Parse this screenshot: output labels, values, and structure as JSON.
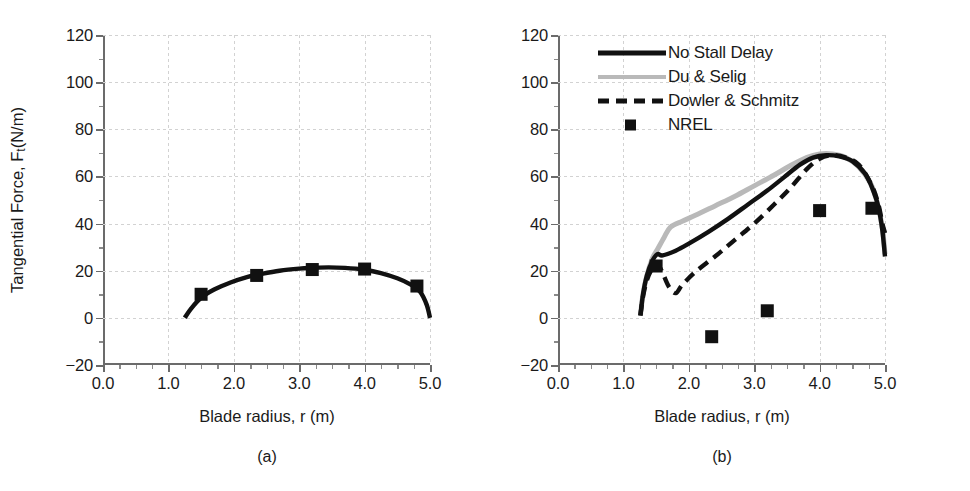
{
  "figure": {
    "panels": [
      {
        "id": "a",
        "subcaption": "(a)",
        "xlabel": "Blade radius, r (m)",
        "ylabel_prefix": "Tangential Force, F",
        "ylabel_sub": "t",
        "ylabel_suffix": "(N/m)"
      },
      {
        "id": "b",
        "subcaption": "(b)",
        "xlabel": "Blade radius, r (m)",
        "ylabel_prefix": "Tangential Force, F",
        "ylabel_sub": "t",
        "ylabel_suffix": "(N/m)"
      }
    ],
    "legend": {
      "position": "top-left-inside-panel-b",
      "items": [
        {
          "label": "No Stall Delay",
          "style": "solid",
          "color": "#111111"
        },
        {
          "label": "Du & Selig",
          "style": "solid",
          "color": "#b9b9b9"
        },
        {
          "label": "Dowler & Schmitz",
          "style": "dashed",
          "color": "#111111"
        },
        {
          "label": "NREL",
          "style": "marker",
          "color": "#111111"
        }
      ]
    }
  },
  "chart_data": [
    {
      "type": "line",
      "panel": "a",
      "title": "",
      "xlabel": "Blade radius, r (m)",
      "ylabel": "Tangential Force, Ft (N/m)",
      "xlim": [
        0.0,
        5.0
      ],
      "ylim": [
        -20,
        120
      ],
      "xticks": [
        "0.0",
        "1.0",
        "2.0",
        "3.0",
        "4.0",
        "5.0"
      ],
      "xtick_values": [
        0.0,
        1.0,
        2.0,
        3.0,
        4.0,
        5.0
      ],
      "yticks": [
        "-20",
        "0",
        "20",
        "40",
        "60",
        "80",
        "100",
        "120"
      ],
      "ytick_values": [
        -20,
        0,
        20,
        40,
        60,
        80,
        100,
        120
      ],
      "grid": true,
      "legend": "none",
      "series": [
        {
          "name": "No Stall Delay",
          "style": "solid",
          "color": "#111111",
          "x": [
            1.25,
            1.35,
            1.5,
            1.7,
            1.95,
            2.2,
            2.4,
            2.7,
            3.0,
            3.2,
            3.45,
            3.7,
            4.0,
            4.25,
            4.5,
            4.7,
            4.85,
            4.95,
            5.0
          ],
          "y": [
            0.0,
            4.0,
            8.5,
            12.0,
            15.0,
            17.3,
            18.5,
            20.0,
            20.9,
            21.2,
            21.4,
            21.2,
            20.4,
            19.0,
            16.8,
            14.2,
            11.0,
            5.5,
            0.0
          ]
        },
        {
          "name": "NREL",
          "style": "marker",
          "color": "#111111",
          "x": [
            1.5,
            2.35,
            3.2,
            4.0,
            4.8
          ],
          "y": [
            10.0,
            18.0,
            20.5,
            20.7,
            13.5
          ]
        }
      ]
    },
    {
      "type": "line",
      "panel": "b",
      "title": "",
      "xlabel": "Blade radius, r (m)",
      "ylabel": "Tangential Force, Ft (N/m)",
      "xlim": [
        0.0,
        5.0
      ],
      "ylim": [
        -20,
        120
      ],
      "xticks": [
        "0.0",
        "1.0",
        "2.0",
        "3.0",
        "4.0",
        "5.0"
      ],
      "xtick_values": [
        0.0,
        1.0,
        2.0,
        3.0,
        4.0,
        5.0
      ],
      "yticks": [
        "-20",
        "0",
        "20",
        "40",
        "60",
        "80",
        "100",
        "120"
      ],
      "ytick_values": [
        -20,
        0,
        20,
        40,
        60,
        80,
        100,
        120
      ],
      "grid": true,
      "legend": "upper-left",
      "series": [
        {
          "name": "No Stall Delay",
          "style": "solid",
          "color": "#111111",
          "x": [
            1.26,
            1.3,
            1.36,
            1.44,
            1.52,
            1.6,
            1.8,
            2.0,
            2.3,
            2.6,
            2.9,
            3.2,
            3.45,
            3.7,
            3.9,
            4.1,
            4.3,
            4.5,
            4.7,
            4.82,
            4.9,
            4.96,
            5.0
          ],
          "y": [
            1.0,
            10.0,
            18.0,
            24.0,
            27.0,
            26.5,
            28.5,
            31.5,
            36.5,
            42.0,
            48.0,
            54.0,
            59.5,
            65.0,
            68.0,
            69.0,
            68.5,
            66.5,
            61.0,
            54.0,
            47.0,
            37.0,
            26.0
          ]
        },
        {
          "name": "Du & Selig",
          "style": "solid",
          "color": "#b9b9b9",
          "x": [
            1.26,
            1.3,
            1.36,
            1.44,
            1.52,
            1.62,
            1.72,
            1.9,
            2.1,
            2.4,
            2.7,
            3.0,
            3.3,
            3.55,
            3.8,
            4.0,
            4.2,
            4.4,
            4.6,
            4.78,
            4.88,
            4.96,
            5.0
          ],
          "y": [
            1.0,
            10.0,
            18.0,
            25.0,
            29.0,
            34.0,
            38.5,
            41.0,
            43.5,
            47.5,
            51.5,
            56.0,
            60.5,
            64.5,
            68.0,
            69.5,
            69.5,
            68.0,
            64.0,
            57.0,
            49.0,
            38.0,
            27.0
          ]
        },
        {
          "name": "Dowler & Schmitz",
          "style": "dashed",
          "color": "#111111",
          "x": [
            1.26,
            1.3,
            1.36,
            1.44,
            1.52,
            1.6,
            1.7,
            1.8,
            1.9,
            2.1,
            2.4,
            2.7,
            3.0,
            3.3,
            3.55,
            3.8,
            4.0,
            4.2,
            4.4,
            4.6,
            4.8,
            4.9,
            4.96,
            5.0
          ],
          "y": [
            1.0,
            9.0,
            16.0,
            21.0,
            23.0,
            19.0,
            13.0,
            10.5,
            14.0,
            19.5,
            26.0,
            33.0,
            40.0,
            48.0,
            55.0,
            63.0,
            67.5,
            69.0,
            68.0,
            65.0,
            56.0,
            48.0,
            40.0,
            36.0
          ]
        },
        {
          "name": "NREL",
          "style": "marker",
          "color": "#111111",
          "x": [
            1.5,
            2.35,
            3.2,
            4.0,
            4.8
          ],
          "y": [
            22.0,
            -8.0,
            3.0,
            45.5,
            46.5
          ]
        }
      ]
    }
  ]
}
